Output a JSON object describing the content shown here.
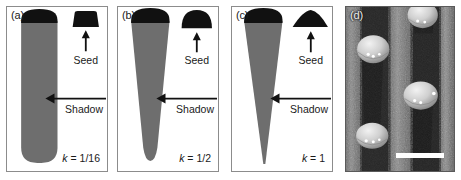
{
  "figure": {
    "kind": "multi-panel scientific figure",
    "panel_count": 4
  },
  "panels": [
    {
      "label": "(a)",
      "k_symbol": "k",
      "k_equals": " = ",
      "k_value": "1/16",
      "seed_label": "Seed",
      "shadow_label": "Shadow",
      "seed_shape": "flat-truncated-cap",
      "shadow_shape": "round-ended-column",
      "shadow_tip_width_ratio": 0.94
    },
    {
      "label": "(b)",
      "k_symbol": "k",
      "k_equals": " = ",
      "k_value": "1/2",
      "seed_label": "Seed",
      "shadow_label": "Shadow",
      "seed_shape": "half-dome-cap",
      "shadow_shape": "tapered-round-tip-column",
      "shadow_tip_width_ratio": 0.22
    },
    {
      "label": "(c)",
      "k_symbol": "k",
      "k_equals": " = ",
      "k_value": "1",
      "seed_label": "Seed",
      "shadow_label": "Shadow",
      "seed_shape": "shallow-wide-dome-cap",
      "shadow_shape": "sharp-pointed-cone",
      "shadow_tip_width_ratio": 0.0
    },
    {
      "label": "(d)",
      "image_type": "SEM micrograph",
      "scalebar": true,
      "particle_count": 4
    }
  ],
  "colors": {
    "shadow_gray": "#6e6e6e",
    "seed_black": "#111111",
    "panel_border": "#8c8c8c",
    "text": "#1a1a1a",
    "background": "#ffffff",
    "scalebar": "#ffffff"
  },
  "micrograph": {
    "particles": [
      {
        "cx": 27,
        "cy": 42,
        "r": 15
      },
      {
        "cx": 76,
        "cy": 9,
        "r": 14
      },
      {
        "cx": 72,
        "cy": 90,
        "r": 16
      },
      {
        "cx": 26,
        "cy": 131,
        "r": 15
      }
    ],
    "stripe_count": 3
  }
}
